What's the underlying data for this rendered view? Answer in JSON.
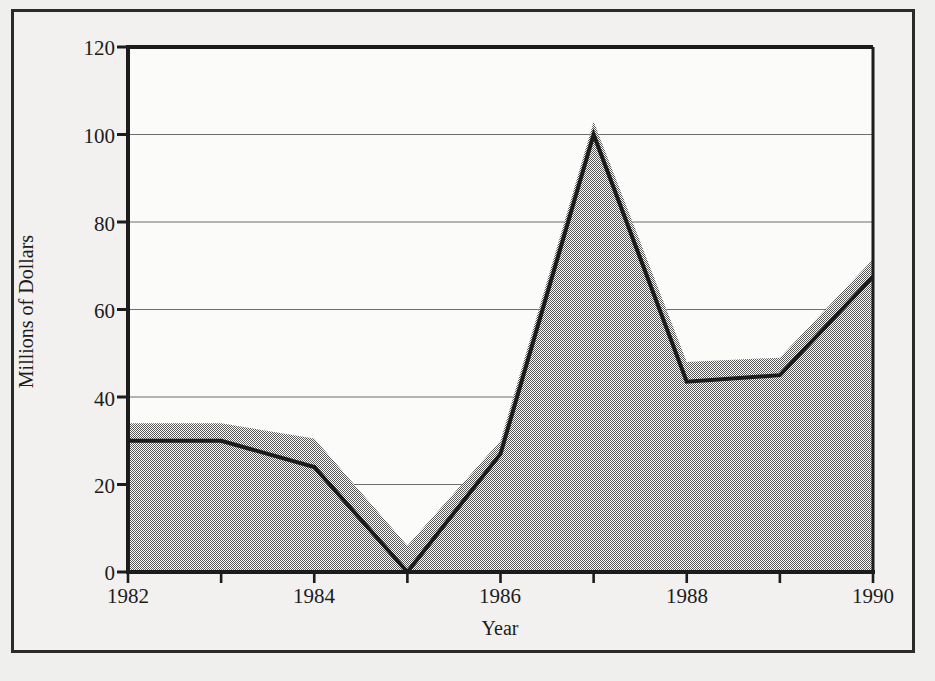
{
  "chart_data": {
    "type": "area",
    "title": "U.S. AID TO CONTRAS",
    "xlabel": "Year",
    "ylabel": "Millions of Dollars",
    "x": [
      1982,
      1983,
      1984,
      1985,
      1986,
      1987,
      1988,
      1989,
      1990
    ],
    "xtick_labels": [
      "1982",
      "1984",
      "1986",
      "1988",
      "1990"
    ],
    "xticks": [
      1982,
      1984,
      1986,
      1988,
      1990
    ],
    "xlim": [
      1982,
      1990
    ],
    "ytick_labels": [
      "0",
      "20",
      "40",
      "60",
      "80",
      "100",
      "120"
    ],
    "yticks": [
      0,
      20,
      40,
      60,
      80,
      100,
      120
    ],
    "ylim": [
      0,
      120
    ],
    "grid": "horizontal",
    "legend": "none",
    "series": [
      {
        "name": "Aid authorized (shaded band upper bound)",
        "style": "filled-area-gray",
        "values": [
          34,
          34,
          30.5,
          6,
          30,
          103,
          48,
          49,
          71.5
        ]
      },
      {
        "name": "Aid delivered",
        "style": "thick-black-line",
        "values": [
          30,
          30,
          24,
          0,
          27,
          100,
          43.5,
          45,
          67.5
        ]
      }
    ],
    "colors": {
      "line": "#1c1c1c",
      "fill": "#9a9a9a",
      "grid": "#6d6d6d",
      "axis": "#1c1c1c",
      "background": "#f2f1ef",
      "page_background": "#efefed",
      "frame_border": "#2b2b2b"
    }
  }
}
